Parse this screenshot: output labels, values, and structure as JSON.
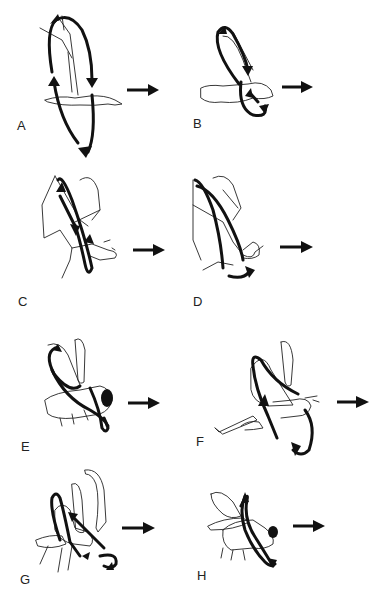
{
  "figure": {
    "panels": [
      {
        "id": "A",
        "label": "A",
        "subject": "bird (gull)",
        "flight_direction": "right-arrow"
      },
      {
        "id": "B",
        "label": "B",
        "subject": "bird (pigeon)",
        "flight_direction": "right-arrow"
      },
      {
        "id": "C",
        "label": "C",
        "subject": "bat",
        "flight_direction": "right-arrow"
      },
      {
        "id": "D",
        "label": "D",
        "subject": "bat",
        "flight_direction": "right-arrow"
      },
      {
        "id": "E",
        "label": "E",
        "subject": "bee",
        "flight_direction": "right-arrow"
      },
      {
        "id": "F",
        "label": "F",
        "subject": "locust",
        "flight_direction": "right-arrow"
      },
      {
        "id": "G",
        "label": "G",
        "subject": "beetle",
        "flight_direction": "right-arrow"
      },
      {
        "id": "H",
        "label": "H",
        "subject": "fly",
        "flight_direction": "right-arrow"
      }
    ],
    "colors": {
      "ink": "#111111",
      "background": "#ffffff"
    }
  }
}
